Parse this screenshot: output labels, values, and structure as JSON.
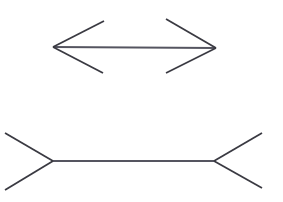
{
  "figure": {
    "name": "muller-lyer-illusion",
    "background_color": "#ffffff",
    "width": 283,
    "height": 202,
    "stroke_color": "#3a3a42",
    "shaft_color": "#555560",
    "stroke_width": 1.8
  },
  "chart_data": {
    "type": "diagram",
    "title": "",
    "xlabel": "",
    "ylabel": "",
    "grid": false,
    "legend": null,
    "xlim": [
      0,
      283
    ],
    "ylim": [
      0,
      202
    ],
    "figures": [
      {
        "id": "top-figure",
        "label": "outward-arrows-figure",
        "fin_direction": "outward",
        "shaft": {
          "x1": 53,
          "y1": 47,
          "x2": 216,
          "y2": 48
        },
        "shaft_length": 163,
        "fins": [
          {
            "id": "left-upper-fin",
            "x1": 53,
            "y1": 47,
            "x2": 104,
            "y2": 21
          },
          {
            "id": "left-lower-fin",
            "x1": 53,
            "y1": 47,
            "x2": 103,
            "y2": 73
          },
          {
            "id": "right-upper-fin",
            "x1": 216,
            "y1": 48,
            "x2": 166,
            "y2": 19
          },
          {
            "id": "right-lower-fin",
            "x1": 216,
            "y1": 48,
            "x2": 166,
            "y2": 73
          }
        ]
      },
      {
        "id": "bottom-figure",
        "label": "inward-fins-figure",
        "fin_direction": "inward",
        "shaft": {
          "x1": 53,
          "y1": 161,
          "x2": 214,
          "y2": 161
        },
        "shaft_length": 161,
        "fins": [
          {
            "id": "left-upper-fin",
            "x1": 53,
            "y1": 161,
            "x2": 5,
            "y2": 133
          },
          {
            "id": "left-lower-fin",
            "x1": 53,
            "y1": 161,
            "x2": 5,
            "y2": 190
          },
          {
            "id": "right-upper-fin",
            "x1": 214,
            "y1": 161,
            "x2": 262,
            "y2": 133
          },
          {
            "id": "right-lower-fin",
            "x1": 214,
            "y1": 161,
            "x2": 262,
            "y2": 188
          }
        ]
      }
    ]
  }
}
